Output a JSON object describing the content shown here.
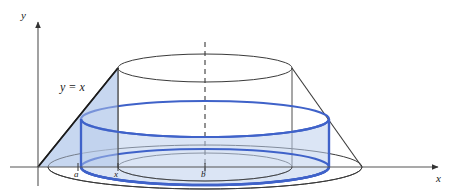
{
  "figure": {
    "background_color": "#ffffff"
  },
  "axes": {
    "x_axis_label": "x",
    "y_axis_label": "y",
    "axis_color": "#555555",
    "origin": {
      "x": 38,
      "y": 167
    },
    "x_axis": {
      "x1": 10,
      "y1": 167,
      "x2": 443,
      "y2": 167
    },
    "y_axis": {
      "x1": 38,
      "y1": 185,
      "x2": 38,
      "y2": 18
    },
    "arrow_color": "#333333"
  },
  "ticks": [
    {
      "name": "a",
      "label": "a",
      "x": 78,
      "y": 167,
      "label_x": 74,
      "label_y": 176
    },
    {
      "name": "x",
      "label": "x",
      "x": 118,
      "y": 167,
      "label_x": 114,
      "label_y": 176
    },
    {
      "name": "b",
      "label": "b",
      "x": 205,
      "y": 167,
      "label_x": 201,
      "label_y": 176
    }
  ],
  "curve": {
    "label": "y = x",
    "label_x": 60,
    "label_y": 90,
    "line_color": "#1a1a1a",
    "line_from": {
      "x": 38,
      "y": 167
    },
    "line_to": {
      "x": 118,
      "y": 68
    }
  },
  "cone": {
    "outline_color": "#3a3a3a",
    "fill_color": "none",
    "top_ellipse": {
      "cx": 205,
      "cy": 68,
      "rx": 87,
      "ry": 14
    },
    "base_ellipse": {
      "cx": 205,
      "cy": 167,
      "rx": 157,
      "ry": 22
    },
    "left_slant": {
      "x1": 38,
      "y1": 167,
      "x2": 118,
      "y2": 68
    },
    "right_slant": {
      "x1": 292,
      "y1": 68,
      "x2": 362,
      "y2": 167
    },
    "center_axis": {
      "x": 205,
      "y_top": 42,
      "y_bottom": 176,
      "dash": "5 4",
      "color": "#3a3a3a"
    }
  },
  "shell": {
    "stroke_color": "#3f62c9",
    "stroke_width": 2.2,
    "fill_color": "#bed0ed",
    "fill_opacity": 0.72,
    "top_ellipse": {
      "cx": 205,
      "cy": 119,
      "rx": 124,
      "ry": 18
    },
    "bottom_ellipse": {
      "cx": 205,
      "cy": 167,
      "rx": 124,
      "ry": 18
    },
    "left_wall_x": 81,
    "right_wall_x": 329,
    "wall_top_y": 119,
    "wall_bottom_y": 167
  },
  "inner_cylinder": {
    "outline_color": "#3a3a3a",
    "top_ellipse": {
      "cx": 205,
      "cy": 68,
      "rx": 87,
      "ry": 14
    },
    "base_ellipse": {
      "cx": 205,
      "cy": 167,
      "rx": 87,
      "ry": 14
    },
    "left_wall_x": 118,
    "right_wall_x": 292
  },
  "shaded_region": {
    "name": "cross-section-slice",
    "fill_color": "#bed0ed",
    "fill_opacity": 0.75,
    "points": "38,167 118,68 118,167"
  },
  "colors": {
    "accent_blue": "#3f62c9",
    "shade_blue": "#bed0ed",
    "ink": "#1a1a1a",
    "axis_gray": "#555555"
  }
}
